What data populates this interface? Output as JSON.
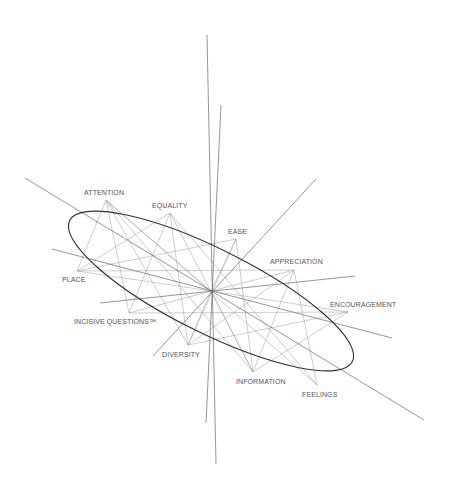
{
  "diagram": {
    "colors": {
      "background": "#ffffff",
      "ellipse": "#333333",
      "axes": "#6a6a6a",
      "edges": "#9a9a9a",
      "labels": "#555555"
    },
    "center": {
      "x": 211,
      "y": 291
    },
    "ellipse": {
      "cx": 211,
      "cy": 291,
      "rx": 158,
      "ry": 42,
      "rotation": 26.5
    },
    "axes": [
      {
        "x1": 207,
        "y1": 35,
        "x2": 216,
        "y2": 464
      },
      {
        "x1": 221,
        "y1": 105,
        "x2": 206,
        "y2": 423
      },
      {
        "x1": 25,
        "y1": 178,
        "x2": 424,
        "y2": 420
      },
      {
        "x1": 52,
        "y1": 249,
        "x2": 392,
        "y2": 338
      },
      {
        "x1": 316,
        "y1": 179,
        "x2": 153,
        "y2": 356
      },
      {
        "x1": 100,
        "y1": 303,
        "x2": 355,
        "y2": 276
      }
    ],
    "nodes": [
      {
        "id": "attention",
        "label": "ATTENTION",
        "x": 106,
        "y": 200,
        "lx": 84,
        "ly": 195
      },
      {
        "id": "equality",
        "label": "EQUALITY",
        "x": 170,
        "y": 213,
        "lx": 152,
        "ly": 208
      },
      {
        "id": "ease",
        "label": "EASE",
        "x": 236,
        "y": 239,
        "lx": 228,
        "ly": 234
      },
      {
        "id": "appreciation",
        "label": "APPRECIATION",
        "x": 294,
        "y": 270,
        "lx": 270,
        "ly": 264
      },
      {
        "id": "encouragement",
        "label": "ENCOURAGEMENT",
        "x": 348,
        "y": 312,
        "lx": 330,
        "ly": 307
      },
      {
        "id": "feelings",
        "label": "FEELINGS",
        "x": 317,
        "y": 385,
        "lx": 302,
        "ly": 397
      },
      {
        "id": "information",
        "label": "INFORMATION",
        "x": 253,
        "y": 372,
        "lx": 236,
        "ly": 384
      },
      {
        "id": "diversity",
        "label": "DIVERSITY",
        "x": 188,
        "y": 345,
        "lx": 162,
        "ly": 357
      },
      {
        "id": "incisive",
        "label": "INCISIVE QUESTIONS™",
        "x": 129,
        "y": 313,
        "lx": 74,
        "ly": 324
      },
      {
        "id": "place",
        "label": "PLACE",
        "x": 77,
        "y": 271,
        "lx": 62,
        "ly": 282
      }
    ],
    "edges": [
      [
        "attention",
        "place"
      ],
      [
        "attention",
        "incisive"
      ],
      [
        "attention",
        "diversity"
      ],
      [
        "attention",
        "center"
      ],
      [
        "attention",
        "information"
      ],
      [
        "attention",
        "feelings"
      ],
      [
        "equality",
        "place"
      ],
      [
        "equality",
        "incisive"
      ],
      [
        "equality",
        "diversity"
      ],
      [
        "equality",
        "information"
      ],
      [
        "equality",
        "feelings"
      ],
      [
        "ease",
        "place"
      ],
      [
        "ease",
        "center"
      ],
      [
        "ease",
        "diversity"
      ],
      [
        "ease",
        "information"
      ],
      [
        "appreciation",
        "place"
      ],
      [
        "appreciation",
        "center"
      ],
      [
        "appreciation",
        "information"
      ],
      [
        "appreciation",
        "feelings"
      ],
      [
        "appreciation",
        "diversity"
      ],
      [
        "encouragement",
        "incisive"
      ],
      [
        "encouragement",
        "diversity"
      ],
      [
        "encouragement",
        "information"
      ],
      [
        "encouragement",
        "center"
      ],
      [
        "incisive",
        "center"
      ],
      [
        "diversity",
        "center"
      ],
      [
        "place",
        "center"
      ],
      [
        "information",
        "center"
      ]
    ]
  }
}
